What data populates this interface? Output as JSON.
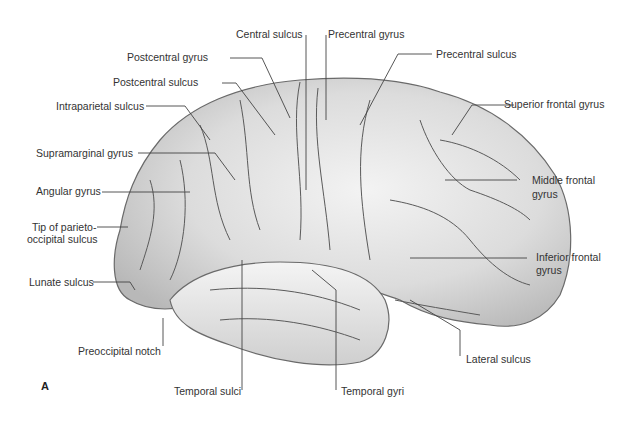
{
  "figure": {
    "panel_letter": "A",
    "colors": {
      "brain_fill": "#d9d9d9",
      "brain_highlight": "#f2f2f2",
      "sulcus_line": "#555555",
      "leader_line": "#444444",
      "label_text": "#333333"
    }
  },
  "labels": {
    "central_sulcus": "Central sulcus",
    "precentral_gyrus": "Precentral gyrus",
    "postcentral_gyrus": "Postcentral gyrus",
    "precentral_sulcus": "Precentral sulcus",
    "postcentral_sulcus": "Postcentral sulcus",
    "intraparietal_sulcus": "Intraparietal sulcus",
    "superior_frontal_gyrus": "Superior frontal gyrus",
    "supramarginal_gyrus": "Supramarginal gyrus",
    "angular_gyrus": "Angular gyrus",
    "middle_frontal_gyrus_1": "Middle frontal",
    "middle_frontal_gyrus_2": "gyrus",
    "tip_parieto_1": "Tip of parieto-",
    "tip_parieto_2": "occipital sulcus",
    "inferior_frontal_gyrus_1": "Inferior frontal",
    "inferior_frontal_gyrus_2": "gyrus",
    "lunate_sulcus": "Lunate sulcus",
    "preoccipital_notch": "Preoccipital notch",
    "lateral_sulcus": "Lateral sulcus",
    "temporal_sulci": "Temporal sulci",
    "temporal_gyri": "Temporal gyri"
  }
}
